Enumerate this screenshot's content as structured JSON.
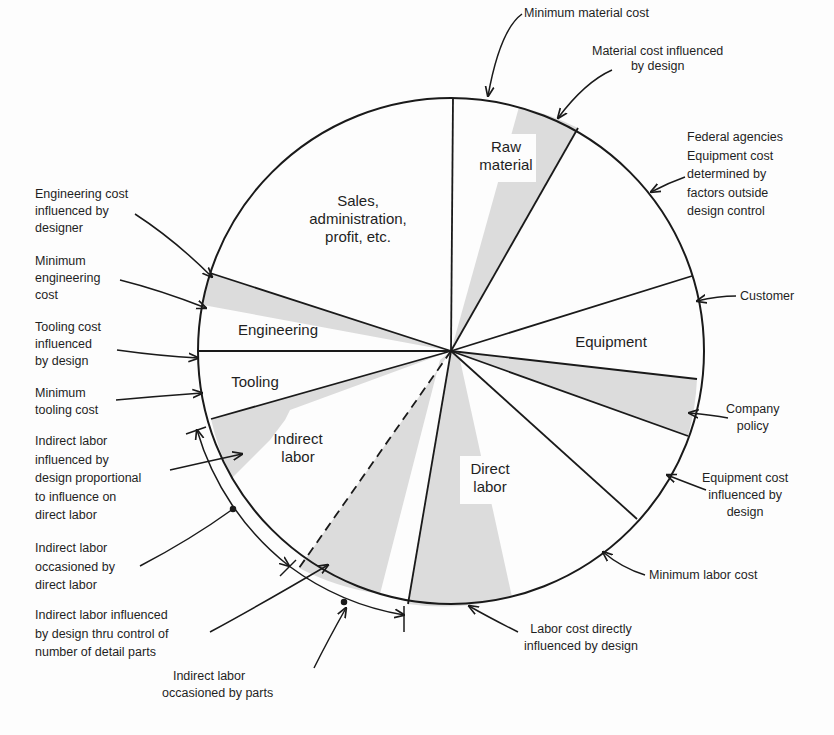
{
  "diagram": {
    "segments": [
      {
        "id": "sales",
        "lines": [
          "Sales,",
          "administration,",
          "profit, etc."
        ]
      },
      {
        "id": "raw-material",
        "lines": [
          "Raw",
          "material"
        ]
      },
      {
        "id": "equipment",
        "lines": [
          "Equipment"
        ]
      },
      {
        "id": "direct-labor",
        "lines": [
          "Direct",
          "labor"
        ]
      },
      {
        "id": "indirect-labor",
        "lines": [
          "Indirect",
          "labor"
        ]
      },
      {
        "id": "tooling",
        "lines": [
          "Tooling"
        ]
      },
      {
        "id": "engineering",
        "lines": [
          "Engineering"
        ]
      }
    ],
    "annotations": {
      "minimum_material_cost": [
        "Minimum material cost"
      ],
      "material_cost_influenced": [
        "Material cost influenced",
        "by design"
      ],
      "federal_agencies": [
        "Federal agencies",
        "Equipment cost",
        "determined by",
        "factors outside",
        "design control"
      ],
      "customer": [
        "Customer"
      ],
      "company_policy": [
        "Company",
        "policy"
      ],
      "equipment_cost_influenced": [
        "Equipment cost",
        "influenced by",
        "design"
      ],
      "minimum_labor_cost": [
        "Minimum labor cost"
      ],
      "labor_cost_direct": [
        "Labor cost directly",
        "influenced by design"
      ],
      "indirect_labor_parts": [
        "Indirect labor",
        "occasioned by parts"
      ],
      "indirect_labor_detail_parts": [
        "Indirect labor influenced",
        "by design thru control of",
        "number of detail parts"
      ],
      "indirect_labor_direct": [
        "Indirect labor",
        "occasioned by",
        "direct labor"
      ],
      "indirect_labor_proportional": [
        "Indirect labor",
        "influenced by",
        "design proportional",
        "to influence on",
        "direct labor"
      ],
      "minimum_tooling_cost": [
        "Minimum",
        "tooling cost"
      ],
      "tooling_cost_influenced": [
        "Tooling cost",
        "influenced",
        "by design"
      ],
      "minimum_engineering_cost": [
        "Minimum",
        "engineering",
        "cost"
      ],
      "engineering_cost_influenced": [
        "Engineering cost",
        "influenced by",
        "designer"
      ]
    },
    "colors": {
      "line": "#1a1a1a",
      "shade": "#dcdcdc",
      "background": "#fdfdfd"
    }
  }
}
